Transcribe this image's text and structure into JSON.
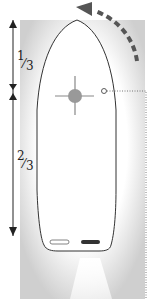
{
  "diagram": {
    "labels": {
      "top_fraction": {
        "num": "1",
        "den": "3"
      },
      "bottom_fraction": {
        "num": "2",
        "den": "3"
      }
    },
    "elements": {
      "hull": "boat-hull-outline",
      "pivot": "pivot-point-marker",
      "rotation_arrow": "dashed-curved-arrow",
      "reference_point": "small-open-circle",
      "leader_line": "dotted-line",
      "propellers": [
        "left-propeller-outline",
        "right-propeller-filled"
      ],
      "prop_wash": "thrust-wash"
    },
    "colors": {
      "line": "#333333",
      "arrow": "#555555",
      "pivot": "#888888",
      "shade": "#d8d8d8"
    }
  }
}
